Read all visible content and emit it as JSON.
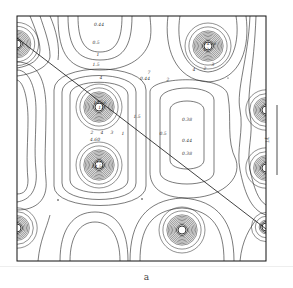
{
  "figure": {
    "caption": "a",
    "scale_bar_label": "1Å"
  },
  "contour_labels": [
    {
      "text": "0.44",
      "x": 99,
      "y": 26
    },
    {
      "text": "0.5",
      "x": 96,
      "y": 44
    },
    {
      "text": "1",
      "x": 98,
      "y": 56
    },
    {
      "text": "1.5",
      "x": 96,
      "y": 66
    },
    {
      "text": "4",
      "x": 101,
      "y": 79
    },
    {
      "text": "7",
      "x": 149,
      "y": 74
    },
    {
      "text": "0.44",
      "x": 145,
      "y": 80
    },
    {
      "text": "14.56",
      "x": 100,
      "y": 104
    },
    {
      "text": "13",
      "x": 101,
      "y": 109
    },
    {
      "text": "2",
      "x": 92,
      "y": 134
    },
    {
      "text": "4",
      "x": 102,
      "y": 134
    },
    {
      "text": "4.60",
      "x": 95,
      "y": 141
    },
    {
      "text": "1",
      "x": 123,
      "y": 135
    },
    {
      "text": "1.5",
      "x": 137,
      "y": 118
    },
    {
      "text": "3",
      "x": 112,
      "y": 134
    },
    {
      "text": "14.56",
      "x": 210,
      "y": 45
    },
    {
      "text": "13",
      "x": 206,
      "y": 51
    },
    {
      "text": "4",
      "x": 194,
      "y": 71
    },
    {
      "text": "2",
      "x": 205,
      "y": 70
    },
    {
      "text": "3",
      "x": 213,
      "y": 66
    },
    {
      "text": "2",
      "x": 168,
      "y": 81
    },
    {
      "text": "0.38",
      "x": 187,
      "y": 121
    },
    {
      "text": "0.44",
      "x": 187,
      "y": 142
    },
    {
      "text": "0.38",
      "x": 187,
      "y": 155
    },
    {
      "text": "0.5",
      "x": 163,
      "y": 135
    },
    {
      "text": "14.56",
      "x": 98,
      "y": 168
    },
    {
      "text": "13",
      "x": 99,
      "y": 163
    }
  ],
  "atoms": [
    {
      "id": "top-left-corner",
      "cx": 17,
      "cy": 44,
      "rings": 10
    },
    {
      "id": "center-upper",
      "cx": 99,
      "cy": 107,
      "rings": 11
    },
    {
      "id": "center-lower",
      "cx": 99,
      "cy": 165,
      "rings": 11
    },
    {
      "id": "top-right",
      "cx": 208,
      "cy": 46,
      "rings": 11
    },
    {
      "id": "right-upper",
      "cx": 266,
      "cy": 110,
      "rings": 9
    },
    {
      "id": "right-lower",
      "cx": 266,
      "cy": 168,
      "rings": 9
    },
    {
      "id": "bottom-left",
      "cx": 17,
      "cy": 228,
      "rings": 9
    },
    {
      "id": "bottom-center",
      "cx": 182,
      "cy": 230,
      "rings": 11
    },
    {
      "id": "bottom-right-corner",
      "cx": 266,
      "cy": 227,
      "rings": 5
    }
  ],
  "colors": {
    "line": "#222222",
    "background": "#ffffff"
  }
}
